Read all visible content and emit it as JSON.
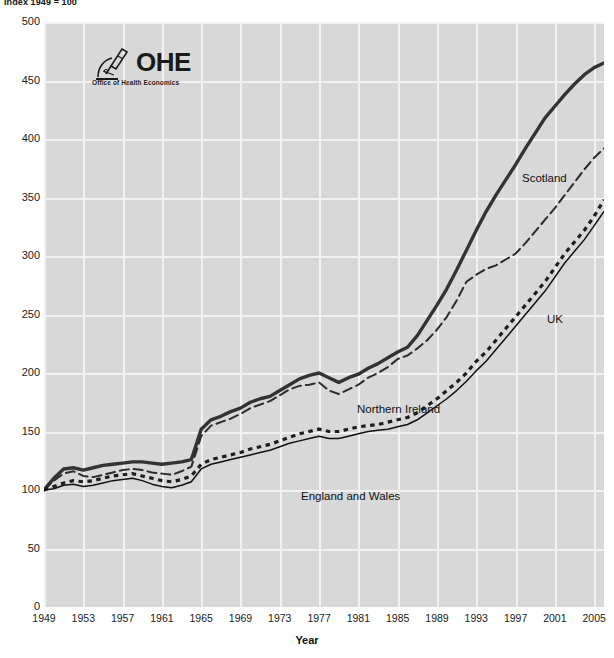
{
  "header": {
    "index_note": "Index 1949 = 100"
  },
  "logo": {
    "acronym": "OHE",
    "subtitle": "Office of Health Economics",
    "icon": "microscope-icon"
  },
  "axes": {
    "y_ticks": [
      500,
      450,
      400,
      350,
      300,
      250,
      200,
      150,
      100,
      50,
      0
    ],
    "x_ticks": [
      1949,
      1953,
      1957,
      1961,
      1965,
      1969,
      1973,
      1977,
      1981,
      1985,
      1989,
      1993,
      1997,
      2001,
      2005
    ],
    "x_title": "Year"
  },
  "annotations": {
    "scotland": "Scotland",
    "northern_ireland": "Northern Ireland",
    "uk": "UK",
    "england_and_wales": "England and Wales"
  },
  "chart_data": {
    "type": "line",
    "title": "",
    "subtitle": "Index 1949 = 100",
    "xlabel": "Year",
    "ylabel": "",
    "xlim": [
      1949,
      2006
    ],
    "ylim": [
      0,
      500
    ],
    "grid": true,
    "legend": "inline-annotations",
    "x": [
      1949,
      1950,
      1951,
      1952,
      1953,
      1954,
      1955,
      1956,
      1957,
      1958,
      1959,
      1960,
      1961,
      1962,
      1963,
      1964,
      1965,
      1966,
      1967,
      1968,
      1969,
      1970,
      1971,
      1972,
      1973,
      1974,
      1975,
      1976,
      1977,
      1978,
      1979,
      1980,
      1981,
      1982,
      1983,
      1984,
      1985,
      1986,
      1987,
      1988,
      1989,
      1990,
      1991,
      1992,
      1993,
      1994,
      1995,
      1996,
      1997,
      1998,
      1999,
      2000,
      2001,
      2002,
      2003,
      2004,
      2005,
      2006
    ],
    "series": [
      {
        "name": "Scotland",
        "style": "thick-solid",
        "color": "#333333",
        "values": [
          100,
          110,
          118,
          119,
          117,
          119,
          121,
          122,
          123,
          124,
          124,
          123,
          122,
          123,
          124,
          126,
          152,
          160,
          163,
          167,
          170,
          175,
          178,
          180,
          185,
          190,
          195,
          198,
          200,
          196,
          192,
          196,
          199,
          204,
          208,
          213,
          218,
          222,
          232,
          245,
          258,
          272,
          288,
          305,
          322,
          338,
          352,
          365,
          378,
          392,
          405,
          418,
          428,
          438,
          447,
          455,
          461,
          465
        ]
      },
      {
        "name": "Northern Ireland",
        "style": "dashed",
        "color": "#2b2b2b",
        "values": [
          100,
          108,
          114,
          116,
          112,
          111,
          113,
          115,
          117,
          118,
          117,
          115,
          114,
          113,
          116,
          120,
          146,
          155,
          158,
          161,
          165,
          170,
          173,
          176,
          181,
          186,
          189,
          190,
          192,
          185,
          182,
          186,
          190,
          196,
          200,
          205,
          212,
          215,
          221,
          228,
          237,
          248,
          262,
          278,
          284,
          289,
          292,
          297,
          302,
          311,
          321,
          331,
          341,
          352,
          363,
          374,
          384,
          392
        ]
      },
      {
        "name": "UK",
        "style": "dotted",
        "color": "#1e1e1e",
        "values": [
          100,
          103,
          106,
          108,
          107,
          108,
          110,
          112,
          113,
          114,
          112,
          110,
          108,
          107,
          109,
          112,
          122,
          126,
          128,
          130,
          132,
          135,
          137,
          139,
          142,
          145,
          148,
          150,
          152,
          150,
          150,
          152,
          154,
          155,
          156,
          158,
          160,
          162,
          166,
          172,
          178,
          185,
          192,
          200,
          210,
          218,
          228,
          238,
          248,
          258,
          268,
          278,
          290,
          302,
          312,
          322,
          334,
          348
        ]
      },
      {
        "name": "England and Wales",
        "style": "thin-solid",
        "color": "#111111",
        "values": [
          100,
          101,
          104,
          105,
          103,
          104,
          106,
          108,
          109,
          110,
          108,
          105,
          103,
          102,
          104,
          107,
          118,
          122,
          124,
          126,
          128,
          130,
          132,
          134,
          137,
          140,
          142,
          144,
          146,
          144,
          144,
          146,
          148,
          150,
          151,
          152,
          154,
          156,
          160,
          166,
          172,
          178,
          185,
          193,
          202,
          210,
          220,
          230,
          240,
          250,
          260,
          270,
          282,
          294,
          304,
          314,
          326,
          338
        ]
      }
    ]
  }
}
